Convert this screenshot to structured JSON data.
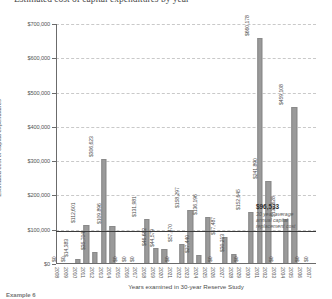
{
  "title": "Estimated cost of capital expenditures by year",
  "chart_data": {
    "type": "bar",
    "title": "Estimated cost of capital expenditures by year",
    "xlabel": "Years examined in 30-year Reserve Study",
    "ylabel": "Estimated cost of capital expenditures",
    "ylim": [
      0,
      700000
    ],
    "ytick_labels": [
      "$700,000",
      "$600,000",
      "$500,000",
      "$400,000",
      "$300,000",
      "$200,000",
      "$100,000",
      "$0"
    ],
    "ytick_values": [
      700000,
      600000,
      500000,
      400000,
      300000,
      200000,
      100000,
      0
    ],
    "grid": true,
    "legend": "none",
    "categories": [
      "2008",
      "2009",
      "2010",
      "2011",
      "2012",
      "2013",
      "2014",
      "2015",
      "2016",
      "2017",
      "2018",
      "2019",
      "2020",
      "2021",
      "2022",
      "2023",
      "2024",
      "2025",
      "2026",
      "2027",
      "2028",
      "2029",
      "2030",
      "2031",
      "2032",
      "2033",
      "2034",
      "2035",
      "2036",
      "2037"
    ],
    "values": [
      0,
      0,
      14383,
      112601,
      35704,
      306623,
      109896,
      0,
      0,
      0,
      131981,
      46682,
      44579,
      0,
      57470,
      158297,
      27440,
      136196,
      0,
      77487,
      30213,
      0,
      152645,
      660178,
      241890,
      0,
      132628,
      459108,
      0,
      0
    ],
    "value_labels": [
      "$0",
      "$0",
      "$14,383",
      "$112,601",
      "$35,704",
      "$306,623",
      "$109,896",
      "$0",
      "$0",
      "$0",
      "$131,981",
      "$46,682",
      "$44,579",
      "$0",
      "$57,470",
      "$158,297",
      "$27,440",
      "$136,196",
      "$0",
      "$77,487",
      "$30,213",
      "$0",
      "$152,645",
      "$660,178",
      "$241,890",
      "$0",
      "$132,628",
      "$459,108",
      "$0",
      "$0"
    ],
    "reference_line": {
      "value": 96533,
      "label": "$96,533",
      "description": "30 year average annual capital replacement cost"
    },
    "bar_color": "#9a9a9a",
    "reference_line_color": "#3a3a3a"
  },
  "annotation": {
    "value": "$96,533",
    "line1": "30 year average",
    "line2": "annual capital",
    "line3": "replacement cost"
  },
  "footer": "Example 6"
}
